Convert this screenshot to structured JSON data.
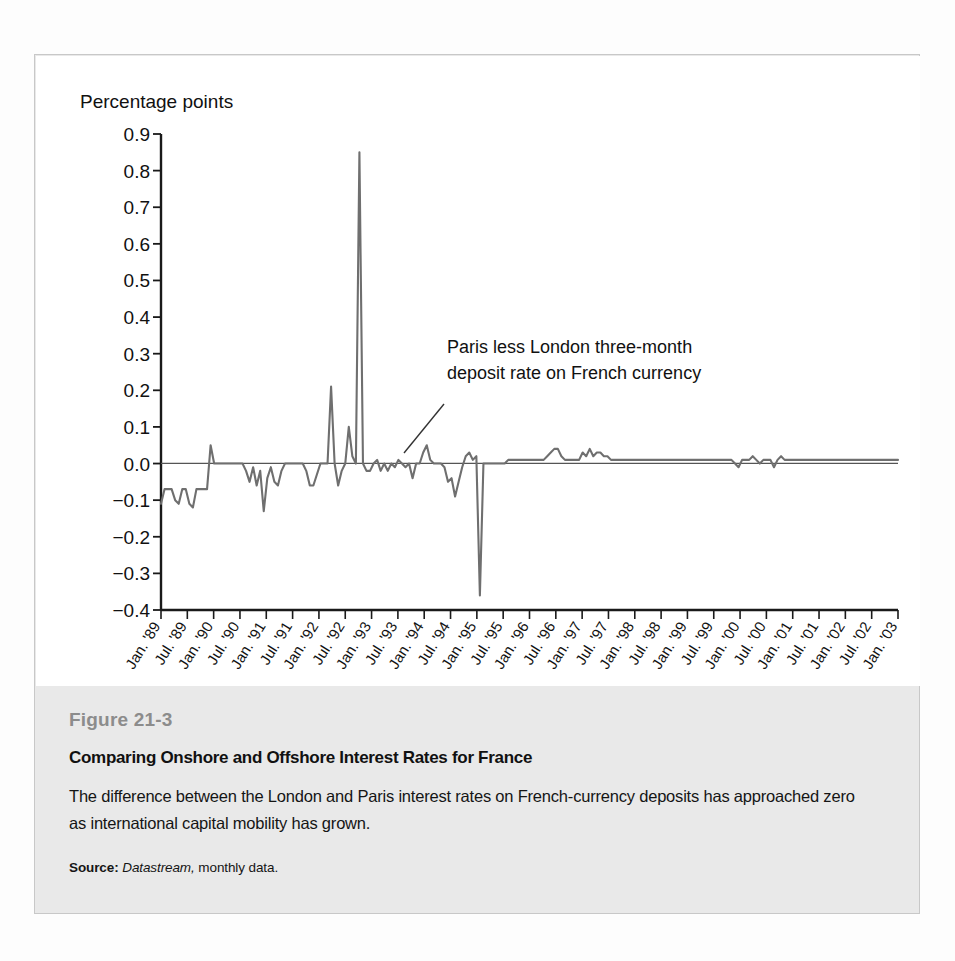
{
  "figure": {
    "number": "Figure 21-3",
    "title": "Comparing Onshore and Offshore Interest Rates for France",
    "description": "The difference between the London and Paris interest rates on French-currency deposits has approached zero as international capital mobility has grown.",
    "source_label": "Source:",
    "source_italic": "Datastream,",
    "source_rest": "monthly data."
  },
  "chart_data": {
    "type": "line",
    "title": "",
    "ylabel": "Percentage points",
    "xlabel": "",
    "ylim": [
      -0.4,
      0.9
    ],
    "ytick_labels": [
      "0.9",
      "0.8",
      "0.7",
      "0.6",
      "0.5",
      "0.4",
      "0.3",
      "0.2",
      "0.1",
      "0.0",
      "−0.1",
      "−0.2",
      "−0.3",
      "−0.4"
    ],
    "ytick_values": [
      0.9,
      0.8,
      0.7,
      0.6,
      0.5,
      0.4,
      0.3,
      0.2,
      0.1,
      0.0,
      -0.1,
      -0.2,
      -0.3,
      -0.4
    ],
    "grid": false,
    "legend_position": "none",
    "zero_line": 0.0,
    "annotations": [
      {
        "name": "series-callout",
        "line1": "Paris less London three-month",
        "line2": "deposit rate on French currency",
        "text_x": 411,
        "text_y": 297,
        "leader_from_x": 408,
        "leader_from_y": 348,
        "leader_to_x": 368,
        "leader_to_y": 397
      }
    ],
    "xtick_labels": [
      "Jan. '89",
      "Jul. '89",
      "Jan. '90",
      "Jul. '90",
      "Jan. '91",
      "Jul. '91",
      "Jan. '92",
      "Jul. '92",
      "Jan. '93",
      "Jul. '93",
      "Jan. '94",
      "Jul. '94",
      "Jan. '95",
      "Jul. '95",
      "Jan. '96",
      "Jul. '96",
      "Jan. '97",
      "Jul. '97",
      "Jan. '98",
      "Jul. '98",
      "Jan. '99",
      "Jul. '99",
      "Jan. '00",
      "Jul. '00",
      "Jan. '01",
      "Jul. '01",
      "Jan. '02",
      "Jul. '02",
      "Jan. '03"
    ],
    "series": [
      {
        "name": "Paris less London three-month deposit rate on French currency",
        "color": "#6f6f6f",
        "x_start_month": "1989-01",
        "x_end_month": "2003-01",
        "frequency": "monthly",
        "values": [
          -0.11,
          -0.07,
          -0.07,
          -0.07,
          -0.1,
          -0.11,
          -0.07,
          -0.07,
          -0.11,
          -0.12,
          -0.07,
          -0.07,
          -0.07,
          -0.07,
          0.05,
          0.0,
          0.0,
          0.0,
          0.0,
          0.0,
          0.0,
          0.0,
          0.0,
          0.0,
          -0.02,
          -0.05,
          -0.01,
          -0.06,
          -0.02,
          -0.13,
          -0.04,
          -0.01,
          -0.05,
          -0.06,
          -0.02,
          0.0,
          0.0,
          0.0,
          0.0,
          0.0,
          0.0,
          -0.02,
          -0.06,
          -0.06,
          -0.03,
          0.0,
          0.0,
          0.0,
          0.21,
          0.0,
          -0.06,
          -0.02,
          0.0,
          0.1,
          0.02,
          0.0,
          0.85,
          0.0,
          -0.02,
          -0.02,
          0.0,
          0.01,
          -0.02,
          0.0,
          -0.02,
          0.0,
          -0.01,
          0.01,
          0.0,
          -0.01,
          0.0,
          -0.04,
          0.0,
          0.0,
          0.03,
          0.05,
          0.01,
          0.0,
          0.0,
          0.0,
          -0.01,
          -0.05,
          -0.04,
          -0.09,
          -0.05,
          -0.01,
          0.02,
          0.03,
          0.01,
          0.02,
          -0.36,
          0.0,
          0.0,
          0.0,
          0.0,
          0.0,
          0.0,
          0.0,
          0.01,
          0.01,
          0.01,
          0.01,
          0.01,
          0.01,
          0.01,
          0.01,
          0.01,
          0.01,
          0.01,
          0.02,
          0.03,
          0.04,
          0.04,
          0.02,
          0.01,
          0.01,
          0.01,
          0.01,
          0.01,
          0.03,
          0.02,
          0.04,
          0.02,
          0.03,
          0.03,
          0.02,
          0.02,
          0.01,
          0.01,
          0.01,
          0.01,
          0.01,
          0.01,
          0.01,
          0.01,
          0.01,
          0.01,
          0.01,
          0.01,
          0.01,
          0.01,
          0.01,
          0.01,
          0.01,
          0.01,
          0.01,
          0.01,
          0.01,
          0.01,
          0.01,
          0.01,
          0.01,
          0.01,
          0.01,
          0.01,
          0.01,
          0.01,
          0.01,
          0.01,
          0.01,
          0.01,
          0.01,
          0.0,
          -0.01,
          0.01,
          0.01,
          0.01,
          0.02,
          0.01,
          0.0,
          0.01,
          0.01,
          0.01,
          -0.01,
          0.01,
          0.02,
          0.01,
          0.01,
          0.01,
          0.01,
          0.01,
          0.01,
          0.01,
          0.01,
          0.01,
          0.01,
          0.01,
          0.01,
          0.01,
          0.01,
          0.01,
          0.01,
          0.01,
          0.01,
          0.01,
          0.01,
          0.01,
          0.01,
          0.01,
          0.01,
          0.01,
          0.01,
          0.01,
          0.01,
          0.01,
          0.01,
          0.01,
          0.01,
          0.01
        ]
      }
    ]
  },
  "axis": {
    "y_axis_color": "#1a1a1a",
    "x_axis_color": "#1a1a1a",
    "line_color": "#6f6f6f",
    "zero_line_color": "#555555"
  }
}
